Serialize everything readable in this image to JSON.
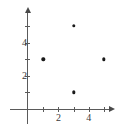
{
  "chart_data": {
    "type": "scatter",
    "title": "",
    "subtitle": "",
    "xlabel": "",
    "ylabel": "",
    "points": [
      {
        "x": 1,
        "y": 3
      },
      {
        "x": 3,
        "y": 5
      },
      {
        "x": 5,
        "y": 3
      },
      {
        "x": 3,
        "y": 1
      }
    ],
    "xlim": [
      0,
      5.6
    ],
    "ylim": [
      0,
      6
    ],
    "x_ticks": [
      1,
      2,
      3,
      4,
      5
    ],
    "y_ticks": [
      1,
      2,
      3,
      4,
      5
    ],
    "x_tick_labels": [
      {
        "value": 2,
        "label": "2"
      },
      {
        "value": 4,
        "label": "4"
      }
    ],
    "y_tick_labels": [
      {
        "value": 2,
        "label": "2"
      },
      {
        "value": 4,
        "label": "4"
      }
    ],
    "grid": false,
    "legend": null,
    "marker_color": "#1a1a1a",
    "axis_color": "#5a5a5a",
    "background_color": "#ffffff"
  },
  "axes": {
    "x_axis_name": "x-axis",
    "y_axis_name": "y-axis"
  }
}
